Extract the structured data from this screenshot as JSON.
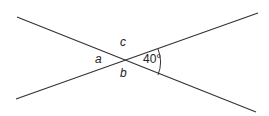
{
  "diagram": {
    "type": "intersecting-lines-angles",
    "labels": {
      "a": "a",
      "b": "b",
      "c": "c",
      "angle": "40°"
    },
    "line_color": "#333333"
  }
}
